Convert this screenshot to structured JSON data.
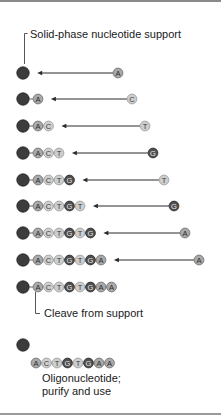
{
  "labels": {
    "support": "Solid-phase nucleotide support",
    "cleave": "Cleave from support",
    "oligo_line1": "Oligonucleotide;",
    "oligo_line2": "purify and use"
  },
  "nucleotide_colors": {
    "A": {
      "fill": "#a9a9a9",
      "stroke": "#6f6f6f",
      "text": "#2a2a2a"
    },
    "C": {
      "fill": "#cfcfcf",
      "stroke": "#9a9a9a",
      "text": "#3a3a3a"
    },
    "T": {
      "fill": "#cdcdcd",
      "stroke": "#9a9a9a",
      "text": "#3a3a3a"
    },
    "G": {
      "fill": "#4e4e4e",
      "stroke": "#2e2e2e",
      "text": "#e8e8e8"
    }
  },
  "support_color": "#3c3c3c",
  "synthesis_steps": [
    {
      "chain": [],
      "incoming": "A",
      "y": 73,
      "incoming_x": 118
    },
    {
      "chain": [
        "A"
      ],
      "incoming": "C",
      "y": 99,
      "incoming_x": 132
    },
    {
      "chain": [
        "A",
        "C"
      ],
      "incoming": "T",
      "y": 126,
      "incoming_x": 145
    },
    {
      "chain": [
        "A",
        "C",
        "T"
      ],
      "incoming": "G",
      "y": 153,
      "incoming_x": 153
    },
    {
      "chain": [
        "A",
        "C",
        "T",
        "G"
      ],
      "incoming": "T",
      "y": 180,
      "incoming_x": 164
    },
    {
      "chain": [
        "A",
        "C",
        "T",
        "G",
        "T"
      ],
      "incoming": "G",
      "y": 206,
      "incoming_x": 174
    },
    {
      "chain": [
        "A",
        "C",
        "T",
        "G",
        "T",
        "G"
      ],
      "incoming": "A",
      "y": 233,
      "incoming_x": 185
    },
    {
      "chain": [
        "A",
        "C",
        "T",
        "G",
        "T",
        "G",
        "A"
      ],
      "incoming": "A",
      "y": 260,
      "incoming_x": 199
    }
  ],
  "final_chain": {
    "chain": [
      "A",
      "C",
      "T",
      "G",
      "T",
      "G",
      "A",
      "A"
    ],
    "y": 287
  },
  "cleaved": {
    "support_y": 345,
    "oligo": [
      "A",
      "C",
      "T",
      "G",
      "T",
      "G",
      "A",
      "A"
    ],
    "oligo_y": 363
  }
}
